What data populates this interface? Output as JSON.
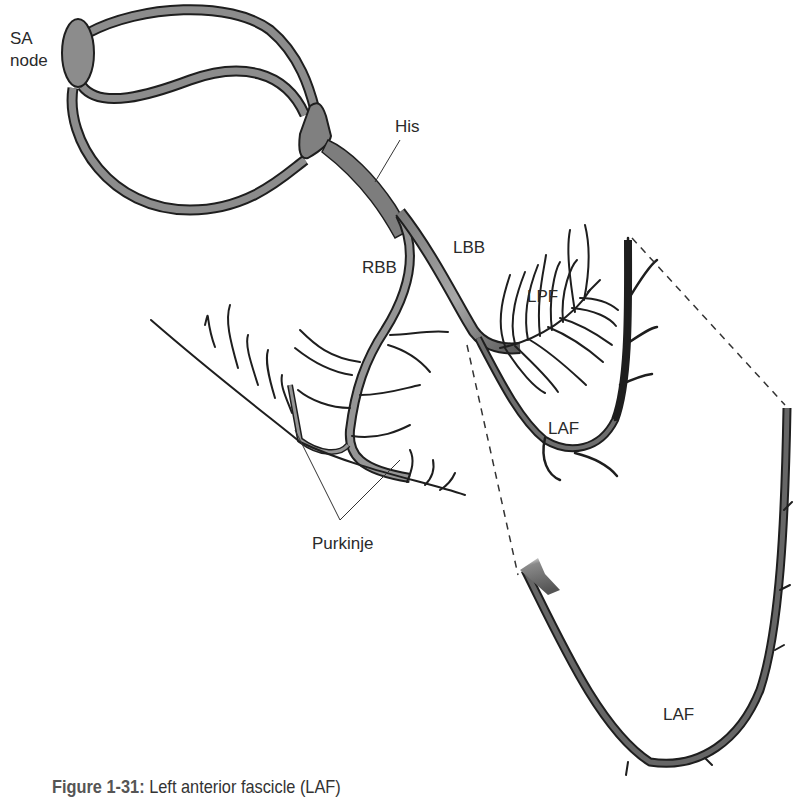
{
  "figure": {
    "labels": {
      "sa_node_line1": "SA",
      "sa_node_line2": "node",
      "his": "His",
      "rbb": "RBB",
      "lbb": "LBB",
      "lpf": "LPF",
      "laf_upper": "LAF",
      "laf_lower": "LAF",
      "purkinje": "Purkinje"
    },
    "caption": {
      "number": "Figure 1-31:",
      "text": " Left anterior fascicle (LAF)"
    },
    "colors": {
      "pathway_fill": "#8c8c8c",
      "outline": "#1e1e1e",
      "background": "#ffffff"
    }
  }
}
